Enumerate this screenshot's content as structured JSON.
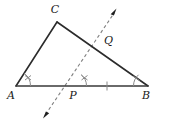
{
  "figure": {
    "type": "geometry-diagram",
    "background_color": "#ffffff",
    "stroke_color": "#2b2b2b",
    "dashed_color": "#7a7a7a",
    "mark_color": "#8a8a8a",
    "labels": {
      "c": "C",
      "q": "Q",
      "a": "A",
      "p": "P",
      "b": "B"
    },
    "points": {
      "A": {
        "x": 16,
        "y": 86
      },
      "B": {
        "x": 148,
        "y": 86
      },
      "C": {
        "x": 57,
        "y": 22
      },
      "P": {
        "x": 72,
        "y": 86
      },
      "Q": {
        "x": 98,
        "y": 44
      },
      "ray_tip_upper": {
        "x": 116,
        "y": 10
      },
      "ray_tip_lower": {
        "x": 45,
        "y": 116
      }
    },
    "label_positions": {
      "C": {
        "x": 55,
        "y": 13
      },
      "Q": {
        "x": 104,
        "y": 44
      },
      "A": {
        "x": 11,
        "y": 99
      },
      "P": {
        "x": 71,
        "y": 99
      },
      "B": {
        "x": 145,
        "y": 99
      }
    },
    "segments": [
      {
        "name": "side-AC",
        "from": "A",
        "to": "C",
        "style": "solid"
      },
      {
        "name": "side-CB",
        "from": "C",
        "to": "B",
        "style": "solid"
      },
      {
        "name": "side-AB",
        "from": "A",
        "to": "B",
        "style": "solid"
      }
    ],
    "ray": {
      "name": "dashed-transversal-ray",
      "style": "dashed",
      "through": [
        "P",
        "Q"
      ],
      "arrowheads": [
        "upper-right",
        "lower-left"
      ]
    },
    "angle_marks": [
      {
        "name": "angle-A",
        "at": "A",
        "ticks": 2,
        "arc": true
      },
      {
        "name": "angle-P",
        "at": "P",
        "ticks": 2,
        "arc": true
      },
      {
        "name": "angle-B",
        "at": "B",
        "ticks": 1,
        "arc": true
      }
    ],
    "segment_marks": [
      {
        "name": "tick-PB",
        "on": "PB",
        "ticks": 1,
        "x": 107,
        "y": 86
      }
    ]
  }
}
